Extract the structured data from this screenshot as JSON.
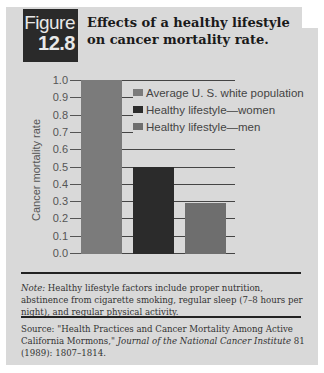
{
  "figure": {
    "label": "Figure",
    "number": "12.8",
    "title_line1": "Effects of a healthy lifestyle",
    "title_line2": "on cancer mortality rate."
  },
  "colors": {
    "panel_bg": "#d9d9d9",
    "badge_bg": "#2a2a2a",
    "average": "#7b7b7b",
    "women": "#2b2b2b",
    "men": "#6e6e6e"
  },
  "chart_data": {
    "type": "bar",
    "title": "Effects of a healthy lifestyle on cancer mortality rate.",
    "xlabel": "",
    "ylabel": "Cancer mortality rate",
    "ylim": [
      0.0,
      1.0
    ],
    "yticks": [
      "0.0",
      "0.1",
      "0.2",
      "0.3",
      "0.4",
      "0.5",
      "0.6",
      "0.7",
      "0.8",
      "0.9",
      "1.0"
    ],
    "grid": true,
    "legend_position": "upper right (inside)",
    "categories": [
      "Average U. S. white population",
      "Healthy lifestyle—women",
      "Healthy lifestyle—men"
    ],
    "values": [
      1.0,
      0.5,
      0.29
    ],
    "legend": [
      "Average U. S. white population",
      "Healthy lifestyle—women",
      "Healthy lifestyle—men"
    ]
  },
  "note": {
    "label": "Note:",
    "text": " Healthy lifestyle factors include proper nutrition, abstinence from cigarette smoking, regular sleep (7–8 hours per night), and regular physical activity."
  },
  "source": {
    "label": "Source:",
    "text_before": "  \"Health Practices and Cancer Mortality Among Active California Mormons,\" ",
    "journal": "Journal of the National Cancer Institute",
    "text_after": " 81 (1989): 1807–1814."
  }
}
